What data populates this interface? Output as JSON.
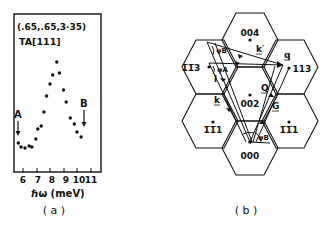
{
  "figure": {
    "panel_a": {
      "caption": "( a )",
      "annotation_line1": "(.65,.65,3·35)",
      "annotation_line2": "TA[111]",
      "xlabel": "ℏω (meV)",
      "arrow_A_label": "A",
      "arrow_B_label": "B"
    },
    "panel_b": {
      "caption": "( b )",
      "lattice_points": [
        {
          "label": "004",
          "x": 250,
          "y": 40
        },
        {
          "label": "1̅1̅3",
          "x": 209,
          "y": 67
        },
        {
          "label": "113",
          "x": 289,
          "y": 68
        },
        {
          "label": "002",
          "x": 250,
          "y": 95
        },
        {
          "label": "1̅1̅1",
          "x": 213,
          "y": 122
        },
        {
          "label": "1̅1̅1",
          "x": 289,
          "y": 122
        },
        {
          "label": "000",
          "x": 250,
          "y": 142
        }
      ],
      "vectors": {
        "k_prime": "k′",
        "q": "q",
        "Q": "Q",
        "G": "G",
        "k": "k",
        "l": "l",
        "phi_B": "φB",
        "phi_A": "φA",
        "psi_B": "ψB"
      }
    }
  },
  "chart_data": {
    "type": "scatter",
    "xlabel": "ℏω (meV)",
    "ylabel": "",
    "xlim": [
      5.6,
      11.8
    ],
    "x_ticks": [
      6,
      7,
      8,
      9,
      10,
      11
    ],
    "grid": false,
    "legend": null,
    "annotations": [
      {
        "text": "A",
        "x": 5.7,
        "arrow": "down"
      },
      {
        "text": "B",
        "x": 10.3,
        "arrow": "down"
      }
    ],
    "series": [
      {
        "name": "TA[111]",
        "x": [
          5.65,
          5.85,
          6.15,
          6.45,
          6.65,
          6.95,
          7.1,
          7.35,
          7.55,
          7.75,
          8.0,
          8.2,
          8.5,
          8.7,
          9.0,
          9.2,
          9.5,
          9.8,
          10.0,
          10.3
        ],
        "y": [
          29,
          25,
          24,
          26,
          25,
          33,
          43,
          46,
          60,
          76,
          88,
          97,
          110,
          99,
          82,
          70,
          54,
          48,
          40,
          35
        ]
      }
    ]
  }
}
